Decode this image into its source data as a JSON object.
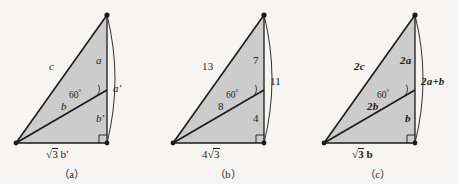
{
  "figure": {
    "background_color": "#f6f5f2",
    "fill_color": "#cccccc",
    "stroke_color": "#1a1a1a",
    "panel_count": 3
  },
  "panels": [
    {
      "id": "panel-a",
      "caption": "（a）",
      "angle_label": "60",
      "angle_unit": "°",
      "labels": {
        "hypotenuse": "c",
        "cevian": "b",
        "upper_vertical": "a",
        "lower_vertical": "b′",
        "arc": "a′",
        "base_radicand": "3",
        "base_coefficient": "",
        "base_suffix": "b′"
      },
      "bold": false
    },
    {
      "id": "panel-b",
      "caption": "（b）",
      "angle_label": "60",
      "angle_unit": "°",
      "labels": {
        "hypotenuse": "13",
        "cevian": "8",
        "upper_vertical": "7",
        "lower_vertical": "4",
        "arc": "11",
        "base_radicand": "3",
        "base_coefficient": "4",
        "base_suffix": ""
      },
      "bold": false
    },
    {
      "id": "panel-c",
      "caption": "（c）",
      "angle_label": "60",
      "angle_unit": "°",
      "labels": {
        "hypotenuse": "2c",
        "cevian": "2b",
        "upper_vertical": "2a",
        "lower_vertical": "b",
        "arc": "2a+b",
        "base_radicand": "3",
        "base_coefficient": "",
        "base_suffix": "b"
      },
      "bold": true
    }
  ]
}
